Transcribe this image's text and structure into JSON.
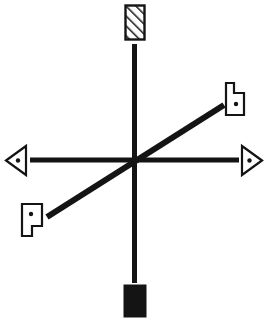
{
  "figure": {
    "canvas": {
      "width": 267,
      "height": 323,
      "background": "#ffffff"
    },
    "ink_color": "#141414",
    "center": {
      "x": 134,
      "y": 160
    },
    "lines": [
      {
        "name": "vertical-line",
        "orientation": "vertical",
        "x1": 134,
        "y1": 44,
        "x2": 134,
        "y2": 283,
        "thickness": 5
      },
      {
        "name": "horizontal-line",
        "orientation": "horizontal",
        "x1": 30,
        "y1": 160,
        "x2": 239,
        "y2": 160,
        "thickness": 5
      },
      {
        "name": "diagonal-line",
        "orientation": "diagonal-ascending",
        "x1": 47,
        "y1": 217,
        "x2": 224,
        "y2": 105,
        "thickness": 6
      }
    ],
    "markers": [
      {
        "name": "hatched-rectangle-marker",
        "position": "top",
        "shape": "rectangle",
        "fill": "diagonal-hatch",
        "hatch_direction": "ascending",
        "outlined": true,
        "has_dot": false,
        "x": 125,
        "y": 5,
        "width": 20,
        "height": 35
      },
      {
        "name": "solid-rectangle-marker",
        "position": "bottom",
        "shape": "rectangle",
        "fill": "solid",
        "outlined": false,
        "has_dot": false,
        "x": 124,
        "y": 285,
        "width": 22,
        "height": 32
      },
      {
        "name": "left-triangle-marker",
        "position": "left",
        "shape": "triangle",
        "points_toward": "left",
        "fill": "white",
        "outlined": true,
        "has_dot": true,
        "dot": {
          "x": 18,
          "y": 160,
          "r": 2.2
        }
      },
      {
        "name": "right-triangle-marker",
        "position": "right",
        "shape": "triangle",
        "points_toward": "right",
        "fill": "white",
        "outlined": true,
        "has_dot": true,
        "dot": {
          "x": 249,
          "y": 160,
          "r": 2.2
        }
      },
      {
        "name": "upper-right-flag-marker",
        "position": "upper-right",
        "shape": "l-polygon",
        "fill": "white",
        "outlined": true,
        "has_dot": true,
        "dot": {
          "x": 235,
          "y": 101,
          "r": 2.2
        }
      },
      {
        "name": "lower-left-flag-marker",
        "position": "lower-left",
        "shape": "l-polygon-rotated-180",
        "fill": "white",
        "outlined": true,
        "has_dot": true,
        "dot": {
          "x": 32,
          "y": 213,
          "r": 2.2
        }
      }
    ],
    "counts": {
      "lines": 3,
      "markers": 6
    }
  }
}
